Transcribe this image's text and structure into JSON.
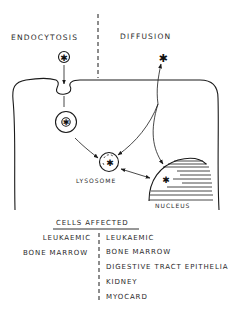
{
  "diagram": {
    "headers": {
      "left": "ENDOCYTOSIS",
      "right": "DIFFUSION"
    },
    "labels": {
      "lysosome": "LYSOSOME",
      "nucleus": "NUCLEUS"
    },
    "symbols": {
      "drug": "✱"
    },
    "cells_affected": {
      "title": "CELLS AFFECTED",
      "endocytosis": [
        "LEUKAEMIC",
        "BONE MARROW"
      ],
      "diffusion": [
        "LEUKAEMIC",
        "BONE MARROW",
        "DIGESTIVE TRACT EPITHELIA",
        "KIDNEY",
        "MYOCARD"
      ]
    }
  }
}
